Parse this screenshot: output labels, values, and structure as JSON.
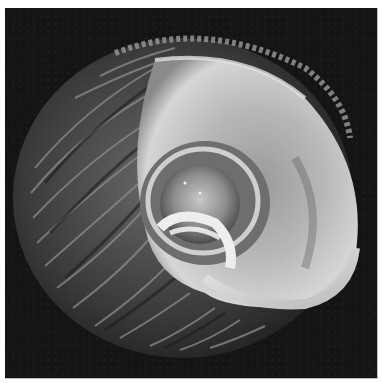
{
  "image": {
    "subject": "seashell",
    "view": "aperture side, spiral umbilicus",
    "tone": "grayscale",
    "colors": {
      "background": "#141414",
      "border": "#ffffff",
      "shell_dark": "#2a2a2a",
      "shell_mid": "#7a7a7a",
      "shell_light": "#d8d8d8",
      "highlight": "#f2f2f2"
    }
  }
}
